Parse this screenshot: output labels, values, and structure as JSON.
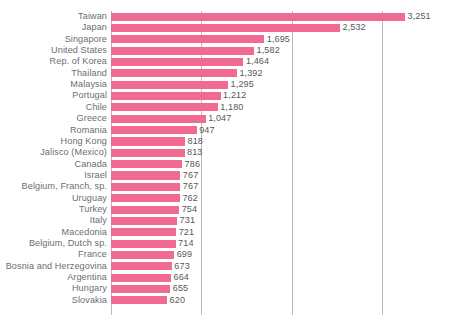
{
  "chart_data": {
    "type": "bar",
    "orientation": "horizontal",
    "title": "",
    "subtitle": "",
    "xlabel": "",
    "ylabel": "",
    "xlim": [
      0,
      3500
    ],
    "grid": true,
    "gridlines": [
      1000,
      2000,
      3000
    ],
    "legend": "none",
    "bar_color": "#f06a91",
    "label_color": "#6d6d72",
    "value_color": "#58585c",
    "gridline_color": "#b9b9bd",
    "categories": [
      "Taiwan",
      "Japan",
      "Singapore",
      "United States",
      "Rep. of Korea",
      "Thailand",
      "Malaysia",
      "Portugal",
      "Chile",
      "Greece",
      "Romania",
      "Hong Kong",
      "Jalisco (Mexico)",
      "Canada",
      "Israel",
      "Belgium, Franch, sp.",
      "Uruguay",
      "Turkey",
      "Italy",
      "Macedonia",
      "Belgium, Dutch sp.",
      "France",
      "Bosnia and Herzegovina",
      "Argentina",
      "Hungary",
      "Slovakia"
    ],
    "values": [
      3251,
      2532,
      1695,
      1582,
      1464,
      1392,
      1295,
      1212,
      1180,
      1047,
      947,
      818,
      813,
      786,
      767,
      767,
      762,
      754,
      731,
      721,
      714,
      699,
      673,
      664,
      655,
      620
    ],
    "value_labels": [
      "3,251",
      "2,532",
      "1,695",
      "1,582",
      "1,464",
      "1,392",
      "1,295",
      "1,212",
      "1,180",
      "1,047",
      "947",
      "818",
      "813",
      "786",
      "767",
      "767",
      "762",
      "754",
      "731",
      "721",
      "714",
      "699",
      "673",
      "664",
      "655",
      "620"
    ]
  }
}
